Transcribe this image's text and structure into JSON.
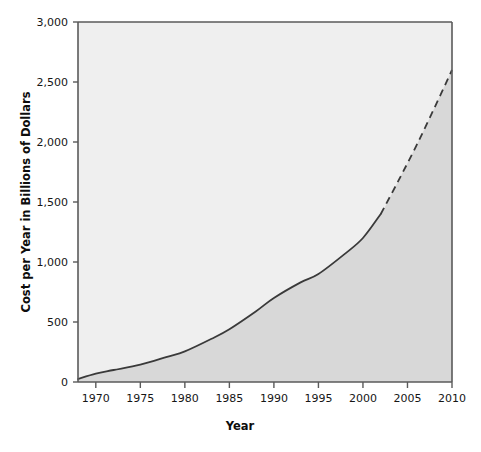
{
  "chart_data": {
    "type": "area",
    "title": "",
    "xlabel": "Year",
    "ylabel": "Cost per Year in Billions of Dollars",
    "xlim": [
      1968,
      2010
    ],
    "ylim": [
      0,
      3000
    ],
    "grid": false,
    "legend": "none",
    "x_ticks": [
      1970,
      1975,
      1980,
      1985,
      1990,
      1995,
      2000,
      2005,
      2010
    ],
    "x_tick_labels": [
      "1970",
      "1975",
      "1980",
      "1985",
      "1990",
      "1995",
      "2000",
      "2005",
      "2010"
    ],
    "y_ticks": [
      0,
      500,
      1000,
      1500,
      2000,
      2500,
      3000
    ],
    "y_tick_labels": [
      "0",
      "500",
      "1,000",
      "1,500",
      "2,000",
      "2,500",
      "3,000"
    ],
    "series": [
      {
        "name": "Actual cost per year",
        "style": "solid",
        "x": [
          1968,
          1970,
          1972,
          1975,
          1978,
          1980,
          1983,
          1985,
          1988,
          1990,
          1993,
          1995,
          1998,
          2000,
          2002
        ],
        "values": [
          25,
          70,
          100,
          145,
          210,
          255,
          360,
          440,
          590,
          700,
          830,
          900,
          1070,
          1200,
          1400
        ]
      },
      {
        "name": "Projected cost per year",
        "style": "dashed",
        "x": [
          2002,
          2004,
          2006,
          2008,
          2010
        ],
        "values": [
          1400,
          1680,
          1970,
          2280,
          2600
        ]
      }
    ],
    "colors": {
      "plot_background": "#efefef",
      "area_fill": "#d8d8d8",
      "line": "#3a3a3a",
      "axis": "#5a5a5a",
      "text": "#161616"
    }
  }
}
